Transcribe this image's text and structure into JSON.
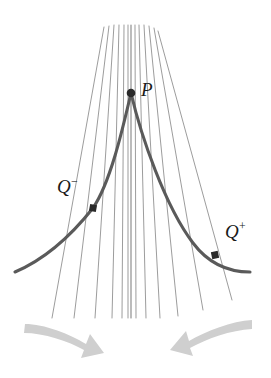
{
  "figure": {
    "background_color": "#ffffff",
    "width": 271,
    "height": 378,
    "labels": {
      "p": {
        "text": "P",
        "x": 141,
        "y": 80
      },
      "q_minus": {
        "base": "Q",
        "sup": "−",
        "x": 57,
        "y": 177
      },
      "q_plus": {
        "base": "Q",
        "sup": "+",
        "x": 225,
        "y": 222
      }
    },
    "colors": {
      "fan_line": "#8a8a8a",
      "curve": "#5a5a5a",
      "point": "#2a2a2a",
      "arrow": "#cfcfcf",
      "label": "#1a1a1a"
    },
    "points": [
      {
        "name": "P",
        "x": 131,
        "y": 93,
        "shape": "dot",
        "radius": 4.2
      },
      {
        "name": "Q-minus",
        "x": 93,
        "y": 208,
        "shape": "square",
        "size": 7
      },
      {
        "name": "Q-plus",
        "x": 215,
        "y": 255,
        "shape": "square",
        "size": 7
      }
    ],
    "curve": {
      "name": "thick-curve",
      "stroke_width": 3.1,
      "left_end": {
        "x": 15,
        "y": 272
      },
      "right_end": {
        "x": 250,
        "y": 272
      },
      "apex": {
        "x": 131,
        "y": 93
      }
    },
    "fan": {
      "name": "pencil-of-lines-through-P",
      "count": 13,
      "stroke_width": 0.85,
      "top_y": 25,
      "bottom_y": 318,
      "description": "Straight lines (secants/tangent) all passing through point P"
    },
    "arrows": [
      {
        "name": "left-arrow",
        "direction": "right-down",
        "from": {
          "x": 25,
          "y": 326
        },
        "to": {
          "x": 98,
          "y": 362
        },
        "color": "#cfcfcf"
      },
      {
        "name": "right-arrow",
        "direction": "left-down",
        "from": {
          "x": 251,
          "y": 322
        },
        "to": {
          "x": 172,
          "y": 358
        },
        "color": "#cfcfcf"
      }
    ]
  }
}
